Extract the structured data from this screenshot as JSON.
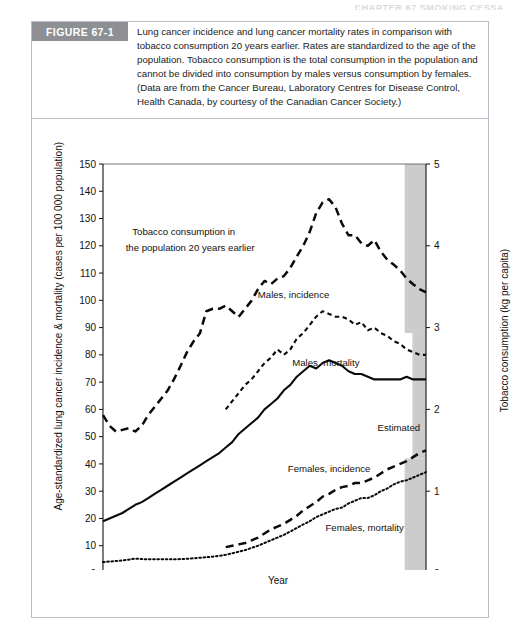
{
  "running_header": "CHAPTER 67 SMOKING CESSA",
  "figure": {
    "tag": "FIGURE 67-1",
    "caption": "Lung cancer incidence and lung cancer mortality rates in comparison with tobacco consumption 20 years earlier. Rates are standardized to the age of the population. Tobacco consumption is the total consumption in the population and cannot be divided into consumption by males versus consumption by females. (Data are from the Cancer Bureau, Laboratory Centres for Disease Control, Health Canada, by courtesy of the Canadian Cancer Society.)"
  },
  "chart_data": {
    "type": "line",
    "title": "",
    "xlabel": "Year",
    "ylabel": "Age-standardized lung cancer incidence & mortality (cases per 100 000 population)",
    "y2label": "Tobacco consumption (kg per capita)",
    "xlim": [
      1950,
      2000
    ],
    "ylim": [
      0,
      150
    ],
    "y2lim": [
      0,
      5
    ],
    "xticks": [
      1950,
      1955,
      1960,
      1965,
      1970,
      1975,
      1980,
      1985,
      1990,
      1995,
      2000
    ],
    "yticks": [
      0,
      10,
      20,
      30,
      40,
      50,
      60,
      70,
      80,
      90,
      100,
      110,
      120,
      130,
      140,
      150
    ],
    "y2ticks": [
      0,
      1,
      2,
      3,
      4,
      5
    ],
    "grid": false,
    "legend_position": "inline-annotations",
    "annotations": [
      {
        "text": "Tobacco consumption in",
        "x": 1962.5,
        "y": 124
      },
      {
        "text": "the population 20 years earlier",
        "x": 1963.5,
        "y": 118
      },
      {
        "text": "Males, incidence",
        "x": 1979.5,
        "y": 101
      },
      {
        "text": "Males, mortality",
        "x": 1984.5,
        "y": 76
      },
      {
        "text": "Estimated",
        "x": 1995.8,
        "y": 52
      },
      {
        "text": "Females, incidence",
        "x": 1985.0,
        "y": 37
      },
      {
        "text": "Females, mortality",
        "x": 1990.5,
        "y": 15.5
      }
    ],
    "shaded_region": {
      "label": "Estimated",
      "color": "#cccccc",
      "segments": [
        {
          "x_start": 1996.7,
          "x_end": 2000,
          "y_top": 150,
          "y_bottom": 88
        },
        {
          "x_start": 1997.9,
          "x_end": 2000,
          "y_top": 88,
          "y_bottom": 42
        },
        {
          "x_start": 1996.7,
          "x_end": 2000,
          "y_top": 42,
          "y_bottom": 0
        }
      ]
    },
    "series": [
      {
        "name": "Tobacco consumption in the population 20 years earlier",
        "axis": "right",
        "style": "long-dash",
        "unit": "kg per capita",
        "x": [
          1950,
          1951,
          1952,
          1953,
          1954,
          1955,
          1956,
          1957,
          1958,
          1959,
          1960,
          1961,
          1962,
          1963,
          1964,
          1965,
          1966,
          1967,
          1968,
          1969,
          1970,
          1971,
          1972,
          1973,
          1974,
          1975,
          1976,
          1977,
          1978,
          1979,
          1980,
          1981,
          1982,
          1983,
          1984,
          1985,
          1986,
          1987,
          1988,
          1989,
          1990,
          1991,
          1992,
          1993,
          1994,
          1995,
          1996,
          1997,
          1998,
          1999,
          2000
        ],
        "values_kg": [
          1.93,
          1.8,
          1.73,
          1.75,
          1.77,
          1.73,
          1.8,
          1.93,
          2.03,
          2.13,
          2.23,
          2.37,
          2.53,
          2.7,
          2.83,
          2.93,
          3.2,
          3.23,
          3.23,
          3.27,
          3.2,
          3.13,
          3.23,
          3.33,
          3.47,
          3.57,
          3.53,
          3.6,
          3.63,
          3.73,
          3.87,
          4.0,
          4.17,
          4.4,
          4.53,
          4.57,
          4.47,
          4.27,
          4.13,
          4.13,
          4.03,
          4.0,
          4.07,
          3.93,
          3.83,
          3.77,
          3.7,
          3.6,
          3.53,
          3.47,
          3.43
        ],
        "values_left_scale_equiv": [
          58,
          54,
          52,
          52.5,
          53,
          52,
          54,
          58,
          61,
          64,
          67,
          71,
          76,
          81,
          85,
          88,
          96,
          97,
          97,
          98,
          96,
          94,
          97,
          100,
          104,
          107,
          106,
          108,
          109,
          112,
          116,
          120,
          125,
          132,
          136,
          137,
          134,
          128,
          124,
          124,
          121,
          120,
          122,
          118,
          115,
          113,
          111,
          108,
          106,
          104,
          103
        ]
      },
      {
        "name": "Males, incidence",
        "axis": "left",
        "style": "short-dash",
        "x": [
          1969,
          1970,
          1971,
          1972,
          1973,
          1974,
          1975,
          1976,
          1977,
          1978,
          1979,
          1980,
          1981,
          1982,
          1983,
          1984,
          1985,
          1986,
          1987,
          1988,
          1989,
          1990,
          1991,
          1992,
          1993,
          1994,
          1995,
          1996,
          1997,
          1998,
          1999,
          2000
        ],
        "values": [
          60,
          63,
          66,
          69,
          71,
          74,
          77,
          79,
          82,
          80,
          82,
          86,
          88,
          91,
          94,
          96,
          95,
          94,
          94,
          93,
          91,
          92,
          89,
          90,
          88,
          87,
          85,
          84,
          82,
          81,
          80,
          80
        ]
      },
      {
        "name": "Males, mortality",
        "axis": "left",
        "style": "solid",
        "x": [
          1950,
          1951,
          1952,
          1953,
          1954,
          1955,
          1956,
          1957,
          1958,
          1959,
          1960,
          1961,
          1962,
          1963,
          1964,
          1965,
          1966,
          1967,
          1968,
          1969,
          1970,
          1971,
          1972,
          1973,
          1974,
          1975,
          1976,
          1977,
          1978,
          1979,
          1980,
          1981,
          1982,
          1983,
          1984,
          1985,
          1986,
          1987,
          1988,
          1989,
          1990,
          1991,
          1992,
          1993,
          1994,
          1995,
          1996,
          1997,
          1998,
          1999,
          2000
        ],
        "values": [
          19,
          20,
          21,
          22,
          23.5,
          25,
          26,
          27.5,
          29,
          30.5,
          32,
          33.5,
          35,
          36.5,
          38,
          39.5,
          41,
          42.5,
          44,
          46,
          48,
          51,
          53,
          55,
          57,
          60,
          62,
          64,
          67,
          69,
          72,
          74,
          76,
          75,
          77,
          78,
          77,
          76,
          74,
          73,
          73,
          72,
          71,
          71,
          71,
          71,
          71,
          72,
          71,
          71,
          71
        ]
      },
      {
        "name": "Females, incidence",
        "axis": "left",
        "style": "long-dash",
        "x": [
          1969,
          1970,
          1971,
          1972,
          1973,
          1974,
          1975,
          1976,
          1977,
          1978,
          1979,
          1980,
          1981,
          1982,
          1983,
          1984,
          1985,
          1986,
          1987,
          1988,
          1989,
          1990,
          1991,
          1992,
          1993,
          1994,
          1995,
          1996,
          1997,
          1998,
          1999,
          2000
        ],
        "values": [
          9.5,
          10,
          10.5,
          11,
          12,
          13,
          14.5,
          16,
          17,
          18,
          19.5,
          21,
          23,
          24.5,
          26,
          28,
          29,
          30.5,
          31.5,
          32,
          33,
          33,
          34,
          35,
          36.5,
          38,
          39,
          40,
          41,
          42.5,
          44,
          45
        ]
      },
      {
        "name": "Females, mortality",
        "axis": "left",
        "style": "dotted",
        "x": [
          1950,
          1951,
          1952,
          1953,
          1954,
          1955,
          1956,
          1957,
          1958,
          1959,
          1960,
          1961,
          1962,
          1963,
          1964,
          1965,
          1966,
          1967,
          1968,
          1969,
          1970,
          1971,
          1972,
          1973,
          1974,
          1975,
          1976,
          1977,
          1978,
          1979,
          1980,
          1981,
          1982,
          1983,
          1984,
          1985,
          1986,
          1987,
          1988,
          1989,
          1990,
          1991,
          1992,
          1993,
          1994,
          1995,
          1996,
          1997,
          1998,
          1999,
          2000
        ],
        "values": [
          4,
          4.2,
          4.4,
          4.6,
          4.9,
          5.3,
          5.1,
          5.0,
          5.0,
          5.0,
          5.0,
          5.0,
          5.1,
          5.2,
          5.4,
          5.6,
          5.8,
          6.0,
          6.3,
          6.7,
          7.2,
          7.8,
          8.4,
          9.2,
          10.0,
          11.0,
          12.0,
          13.0,
          14.0,
          15.2,
          16.5,
          17.8,
          19.0,
          20.5,
          21.5,
          22.5,
          23.5,
          24.0,
          25.5,
          26.5,
          27.5,
          27.5,
          28.5,
          30.0,
          31.0,
          32.5,
          33.5,
          34.0,
          35.0,
          36.0,
          37.0
        ]
      }
    ]
  }
}
